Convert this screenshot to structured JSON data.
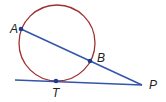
{
  "diagram": {
    "title": "",
    "colors": {
      "circle": "#a03030",
      "lines": "#3355aa",
      "points": "#1a3d8f",
      "labels": "#222222"
    },
    "circle": {
      "cx": 57,
      "cy": 43,
      "r": 38
    },
    "points": [
      {
        "name": "A",
        "x": 21,
        "y": 29,
        "label_x": 10,
        "label_y": 33
      },
      {
        "name": "B",
        "x": 90,
        "y": 61,
        "label_x": 98,
        "label_y": 62
      },
      {
        "name": "T",
        "x": 56,
        "y": 81,
        "label_x": 52,
        "label_y": 96
      },
      {
        "name": "P",
        "x": 142,
        "y": 85,
        "label_x": 149,
        "label_y": 89
      }
    ],
    "segments": [
      {
        "name": "secant-AP",
        "from": "A",
        "to": "P"
      },
      {
        "name": "tangent-TP",
        "x1": 15,
        "y1": 80,
        "to": "P"
      }
    ]
  }
}
